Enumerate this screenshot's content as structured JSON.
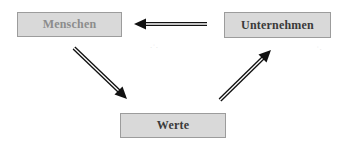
{
  "diagram": {
    "type": "cycle-flow",
    "nodes": [
      {
        "id": "menschen",
        "label": "Menschen"
      },
      {
        "id": "unternehmen",
        "label": "Unternehmen"
      },
      {
        "id": "werte",
        "label": "Werte"
      }
    ],
    "edges": [
      {
        "from": "unternehmen",
        "to": "menschen",
        "style": "double-line-arrow"
      },
      {
        "from": "menschen",
        "to": "werte",
        "style": "double-line-arrow"
      },
      {
        "from": "werte",
        "to": "unternehmen",
        "style": "double-line-arrow"
      }
    ],
    "colors": {
      "node_fill": "#d9d9d9",
      "node_border": "#9c9c9c",
      "label_muted": "#8c8c8c",
      "label_dark": "#3a3a3a",
      "arrow": "#111111"
    }
  }
}
